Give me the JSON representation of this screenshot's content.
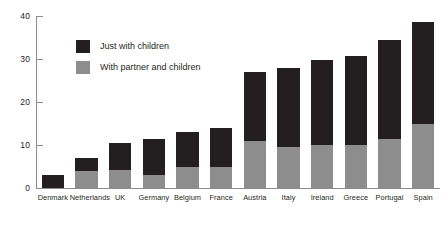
{
  "chart_data": {
    "type": "bar",
    "subtype": "stacked-vertical",
    "title": "",
    "xlabel": "",
    "ylabel": "",
    "ylim": [
      0,
      40
    ],
    "yticks": [
      0,
      10,
      20,
      30,
      40
    ],
    "ytick_labels": [
      "0",
      "10",
      "20",
      "30",
      "40"
    ],
    "grid": false,
    "legend_position": "upper-left-inside",
    "categories": [
      "Denmark",
      "Netherlands",
      "UK",
      "Germany",
      "Belgium",
      "France",
      "Austria",
      "Italy",
      "Ireland",
      "Greece",
      "Portugal",
      "Spain"
    ],
    "series": [
      {
        "name": "With partner and children",
        "color": "#8d8d8d",
        "values": [
          0,
          4,
          4.2,
          3,
          5,
          5,
          11,
          9.5,
          10,
          10,
          11.5,
          14.8
        ]
      },
      {
        "name": "Just with children",
        "color": "#231f20",
        "values": [
          3,
          3,
          6.3,
          8.5,
          8,
          9,
          16,
          18.5,
          19.7,
          20.7,
          23,
          23.7
        ]
      }
    ],
    "totals": [
      3,
      7,
      10.5,
      11.5,
      13,
      14,
      27,
      28,
      29.7,
      30.7,
      34.5,
      38.5
    ]
  },
  "legend": {
    "items": [
      {
        "label": "Just with children",
        "color": "#231f20"
      },
      {
        "label": "With partner and children",
        "color": "#8d8d8d"
      }
    ]
  },
  "axis": {
    "y_ticks": [
      "0",
      "10",
      "20",
      "30",
      "40"
    ]
  },
  "colors": {
    "black": "#231f20",
    "gray": "#8d8d8d",
    "axis": "#8c8c8c",
    "background": "#ffffff"
  }
}
